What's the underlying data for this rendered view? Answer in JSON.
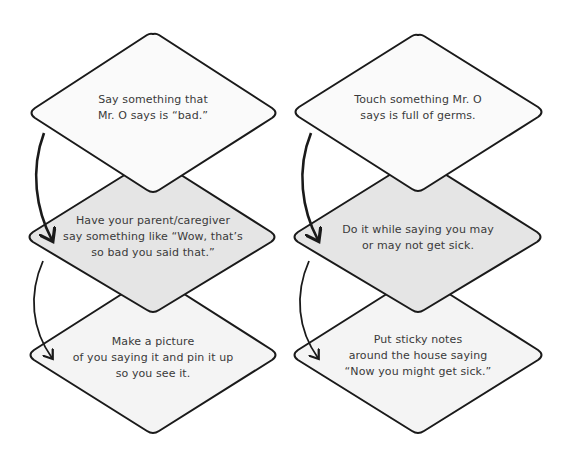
{
  "colors": {
    "stroke": "#1a1a1a",
    "text": "#3a3a3a",
    "fill_top": "#fafafa",
    "fill_middle": "#e5e5e5",
    "fill_bottom": "#f4f4f4"
  },
  "columns": [
    {
      "steps": [
        {
          "lines": [
            "Say something that",
            "Mr. O says is “bad.”"
          ]
        },
        {
          "lines": [
            "Have your parent/caregiver",
            "say something like “Wow, that’s",
            "so bad you said that.”"
          ]
        },
        {
          "lines": [
            "Make a picture",
            "of you saying it and pin it up",
            "so you see it."
          ]
        }
      ]
    },
    {
      "steps": [
        {
          "lines": [
            "Touch something Mr. O",
            "says is full of germs."
          ]
        },
        {
          "lines": [
            "Do it while saying you may",
            "or may not get sick."
          ]
        },
        {
          "lines": [
            "Put sticky notes",
            "around the house saying",
            "“Now you might get sick.”"
          ]
        }
      ]
    }
  ]
}
